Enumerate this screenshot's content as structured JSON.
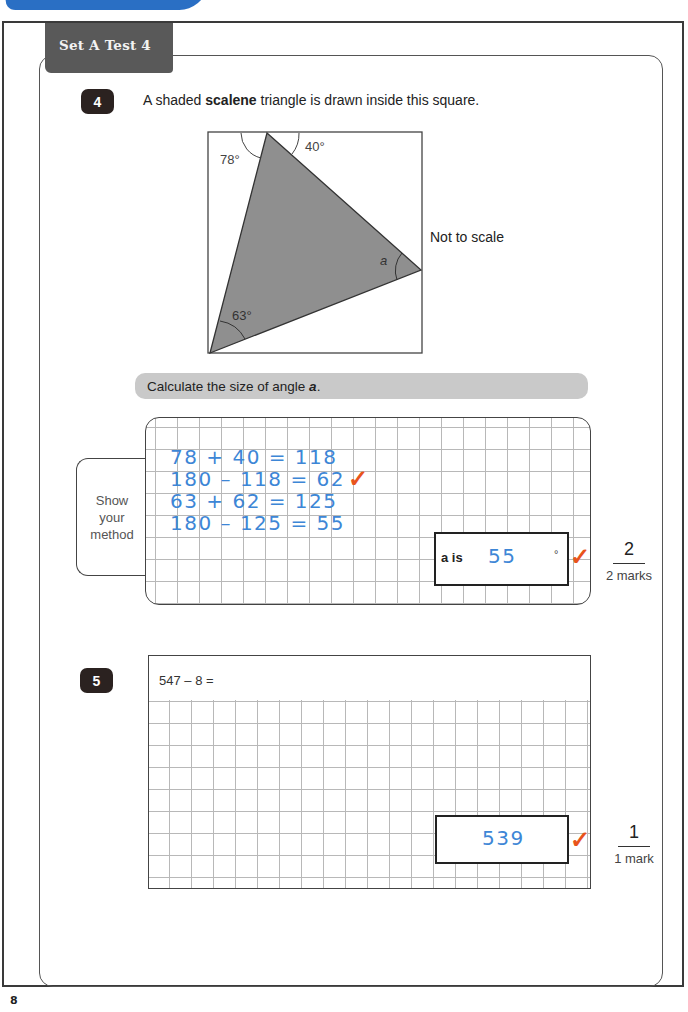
{
  "header": {
    "title": "Set A  Test 4"
  },
  "page_number": "8",
  "question4": {
    "number": "4",
    "prompt_before": "A shaded ",
    "prompt_bold": "scalene",
    "prompt_after": " triangle is drawn inside this square.",
    "diagram": {
      "angle_top_left": "78°",
      "angle_top_right": "40°",
      "angle_bottom_left": "63°",
      "angle_unknown": "a",
      "note": "Not to scale"
    },
    "instruction_before": "Calculate the size of angle ",
    "instruction_bold": "a",
    "instruction_after": ".",
    "method_label": [
      "Show",
      "your",
      "method"
    ],
    "working": [
      "78 + 40 = 118",
      "180 – 118 = 62",
      "63 + 62 = 125",
      "180 – 125 = 55"
    ],
    "answer_label": "a is",
    "answer_value": "55",
    "answer_unit": "°",
    "tick": "✓",
    "marks_awarded": "2",
    "marks_label": "2 marks"
  },
  "question5": {
    "number": "5",
    "prompt": "547 – 8 =",
    "answer_value": "539",
    "tick": "✓",
    "marks_awarded": "1",
    "marks_label": "1 mark"
  },
  "colors": {
    "handwriting": "#3d86d6",
    "tick": "#e8541c",
    "header_tab": "#595959",
    "triangle_fill": "#8f8f8f"
  }
}
